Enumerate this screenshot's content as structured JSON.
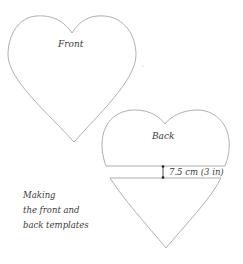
{
  "diagram": {
    "front_template": {
      "label": "Front"
    },
    "back_template": {
      "label": "Back"
    },
    "gap_dimension": {
      "label": "7.5 cm (3 in)"
    },
    "caption": {
      "lines": [
        "Making",
        "the front and",
        "back templates"
      ]
    },
    "colors": {
      "outline": "#9a9a9a",
      "text": "#3a3a3a",
      "marker": "#222222",
      "background": "#ffffff"
    }
  }
}
